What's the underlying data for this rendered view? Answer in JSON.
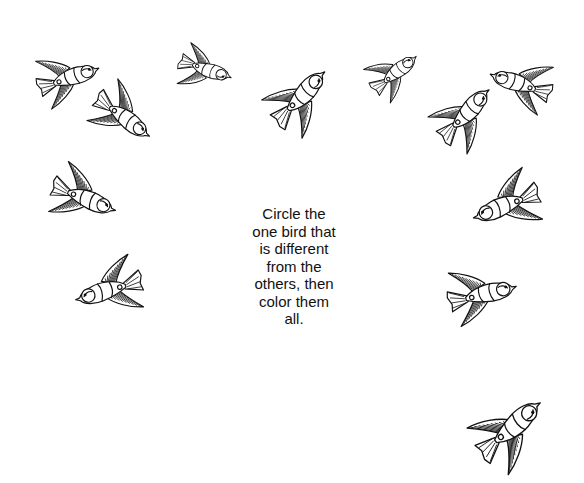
{
  "worksheet": {
    "instruction_lines": [
      "Circle the",
      "one bird that",
      "is different",
      "from the",
      "others, then",
      "color them",
      "all."
    ]
  },
  "birds": [
    {
      "id": 1,
      "x": 33,
      "y": 40,
      "w": 68,
      "h": 72,
      "rot": -20,
      "flip": false
    },
    {
      "id": 2,
      "x": 87,
      "y": 86,
      "w": 74,
      "h": 56,
      "rot": 35,
      "flip": false
    },
    {
      "id": 3,
      "x": 175,
      "y": 35,
      "w": 58,
      "h": 72,
      "rot": 200,
      "flip": true
    },
    {
      "id": 4,
      "x": 264,
      "y": 70,
      "w": 76,
      "h": 60,
      "rot": 135,
      "flip": true
    },
    {
      "id": 5,
      "x": 364,
      "y": 34,
      "w": 58,
      "h": 76,
      "rot": -40,
      "flip": false
    },
    {
      "id": 6,
      "x": 430,
      "y": 88,
      "w": 74,
      "h": 58,
      "rot": 135,
      "flip": true
    },
    {
      "id": 7,
      "x": 488,
      "y": 45,
      "w": 68,
      "h": 74,
      "rot": 20,
      "flip": true
    },
    {
      "id": 8,
      "x": 45,
      "y": 166,
      "w": 78,
      "h": 58,
      "rot": 20,
      "flip": false
    },
    {
      "id": 9,
      "x": 72,
      "y": 252,
      "w": 74,
      "h": 70,
      "rot": -15,
      "flip": true
    },
    {
      "id": 10,
      "x": 467,
      "y": 172,
      "w": 78,
      "h": 60,
      "rot": -20,
      "flip": true
    },
    {
      "id": 11,
      "x": 444,
      "y": 256,
      "w": 74,
      "h": 72,
      "rot": -15,
      "flip": false
    },
    {
      "id": 12,
      "x": 470,
      "y": 397,
      "w": 84,
      "h": 70,
      "rot": 140,
      "flip": true
    }
  ],
  "colors": {
    "ink": "#111111",
    "paper": "#ffffff"
  }
}
